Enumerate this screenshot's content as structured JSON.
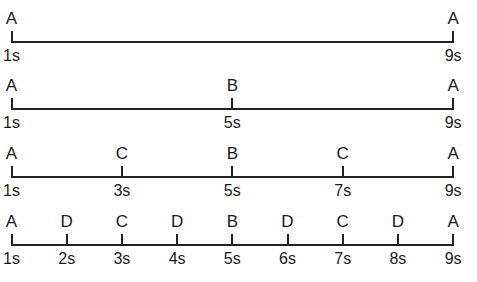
{
  "diagram": {
    "type": "timeline-subdivision",
    "axis_color": "#222222",
    "rows": [
      {
        "markers": [
          {
            "event": "A",
            "time": "1s",
            "t": 1
          },
          {
            "event": "A",
            "time": "9s",
            "t": 9
          }
        ]
      },
      {
        "markers": [
          {
            "event": "A",
            "time": "1s",
            "t": 1
          },
          {
            "event": "B",
            "time": "5s",
            "t": 5
          },
          {
            "event": "A",
            "time": "9s",
            "t": 9
          }
        ]
      },
      {
        "markers": [
          {
            "event": "A",
            "time": "1s",
            "t": 1
          },
          {
            "event": "C",
            "time": "3s",
            "t": 3
          },
          {
            "event": "B",
            "time": "5s",
            "t": 5
          },
          {
            "event": "C",
            "time": "7s",
            "t": 7
          },
          {
            "event": "A",
            "time": "9s",
            "t": 9
          }
        ]
      },
      {
        "markers": [
          {
            "event": "A",
            "time": "1s",
            "t": 1
          },
          {
            "event": "D",
            "time": "2s",
            "t": 2
          },
          {
            "event": "C",
            "time": "3s",
            "t": 3
          },
          {
            "event": "D",
            "time": "4s",
            "t": 4
          },
          {
            "event": "B",
            "time": "5s",
            "t": 5
          },
          {
            "event": "D",
            "time": "6s",
            "t": 6
          },
          {
            "event": "C",
            "time": "7s",
            "t": 7
          },
          {
            "event": "D",
            "time": "8s",
            "t": 8
          },
          {
            "event": "A",
            "time": "9s",
            "t": 9
          }
        ]
      }
    ]
  }
}
